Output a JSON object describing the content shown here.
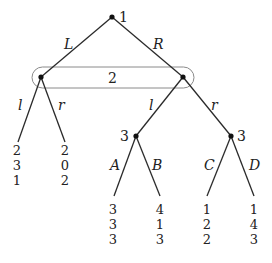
{
  "colors": {
    "edge": "#2a2a2a",
    "node": "#111111",
    "oval": "#8a8a8a",
    "text": "#222222"
  },
  "nodes": {
    "root": {
      "player": "1",
      "x": 112,
      "y": 17
    },
    "p2_left": {
      "x": 41,
      "y": 77
    },
    "p2_right": {
      "x": 183,
      "y": 77
    },
    "p3_left": {
      "player": "3",
      "x": 136,
      "y": 136
    },
    "p3_right": {
      "player": "3",
      "x": 231,
      "y": 136
    }
  },
  "info_set": {
    "player": "2",
    "label_x": 113,
    "label_y": 83
  },
  "edges": {
    "L": "L",
    "R": "R",
    "left_l": "l",
    "left_r": "r",
    "right_l": "l",
    "right_r": "r",
    "A": "A",
    "B": "B",
    "C": "C",
    "D": "D"
  },
  "payoffs": {
    "left_l": [
      "2",
      "3",
      "1"
    ],
    "left_r": [
      "2",
      "0",
      "2"
    ],
    "A": [
      "3",
      "3",
      "3"
    ],
    "B": [
      "4",
      "1",
      "3"
    ],
    "C": [
      "1",
      "2",
      "2"
    ],
    "D": [
      "1",
      "4",
      "3"
    ]
  }
}
